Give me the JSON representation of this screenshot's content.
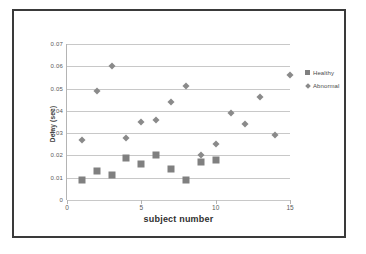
{
  "chart_data": {
    "type": "scatter",
    "title": "",
    "xlabel": "subject number",
    "ylabel": "Delay (sec)",
    "xlim": [
      0,
      15
    ],
    "ylim": [
      0,
      0.07
    ],
    "xticks": [
      "0",
      "5",
      "10",
      "15"
    ],
    "xtick_values": [
      0,
      5,
      10,
      15
    ],
    "yticks": [
      "0",
      "0.01",
      "0.02",
      "0.03",
      "0.04",
      "0.05",
      "0.06",
      "0.07"
    ],
    "ytick_values": [
      0,
      0.01,
      0.02,
      0.03,
      0.04,
      0.05,
      0.06,
      0.07
    ],
    "grid": "horizontal",
    "legend_position": "right",
    "series": [
      {
        "name": "Healthy",
        "marker": "square",
        "color": "#808080",
        "x": [
          1,
          2,
          3,
          4,
          5,
          6,
          7,
          8,
          9,
          10
        ],
        "y": [
          0.009,
          0.013,
          0.011,
          0.019,
          0.016,
          0.02,
          0.014,
          0.009,
          0.017,
          0.018
        ]
      },
      {
        "name": "Abnormal",
        "marker": "diamond",
        "color": "#8a8a8a",
        "x": [
          1,
          2,
          3,
          4,
          5,
          6,
          7,
          8,
          9,
          10,
          11,
          12,
          13,
          14,
          15
        ],
        "y": [
          0.027,
          0.049,
          0.06,
          0.028,
          0.035,
          0.036,
          0.044,
          0.051,
          0.02,
          0.025,
          0.039,
          0.034,
          0.046,
          0.029,
          0.056
        ]
      }
    ]
  },
  "legend": {
    "entries": [
      {
        "label": "Healthy"
      },
      {
        "label": "Abnormal"
      }
    ]
  }
}
